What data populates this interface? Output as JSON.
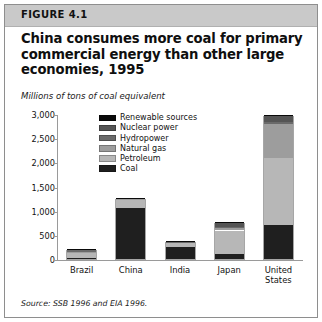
{
  "figure": {
    "header_label": "FIGURE 4.1",
    "title": "China consumes more coal for primary commercial energy than other large economies, 1995",
    "subtitle": "Millions of tons of coal equivalent",
    "source": "Source: SSB 1996 and EIA 1996."
  },
  "colors": {
    "coal": "#1f1f1f",
    "petroleum": "#b7b7b7",
    "natural_gas": "#9d9d9d",
    "hydropower": "#6a6a6a",
    "nuclear_power": "#555555",
    "renewable_sources": "#0a0a0a",
    "axis": "#9a9a9a",
    "header_band": "#c9c9c9",
    "border": "#8e8e8e"
  },
  "chart_data": {
    "type": "bar",
    "title": "China consumes more coal for primary commercial energy than other large economies, 1995",
    "subtitle": "Millions of tons of coal equivalent",
    "xlabel": "",
    "ylabel": "Millions of tons of coal equivalent",
    "ylim": [
      0,
      3000
    ],
    "yticks": [
      "0",
      "500",
      "1,000",
      "1,500",
      "2,000",
      "2,500",
      "3,000"
    ],
    "ytick_values": [
      0,
      500,
      1000,
      1500,
      2000,
      2500,
      3000
    ],
    "grid": false,
    "stacked": true,
    "legend_position": "inside-top-center",
    "categories": [
      "Brazil",
      "China",
      "India",
      "Japan",
      "United States"
    ],
    "series": [
      {
        "name": "Coal",
        "color": "#1f1f1f",
        "values": [
          20,
          1050,
          250,
          110,
          700
        ]
      },
      {
        "name": "Petroleum",
        "color": "#b7b7b7",
        "values": [
          120,
          180,
          85,
          480,
          1400
        ]
      },
      {
        "name": "Natural gas",
        "color": "#9d9d9d",
        "values": [
          10,
          10,
          15,
          55,
          700
        ]
      },
      {
        "name": "Hydropower",
        "color": "#6a6a6a",
        "values": [
          45,
          25,
          10,
          20,
          30
        ]
      },
      {
        "name": "Nuclear power",
        "color": "#555555",
        "values": [
          5,
          5,
          5,
          95,
          120
        ]
      },
      {
        "name": "Renewable sources",
        "color": "#0a0a0a",
        "values": [
          2,
          2,
          2,
          5,
          20
        ]
      }
    ],
    "totals": [
      202,
      1272,
      367,
      765,
      2970
    ]
  },
  "legend": {
    "items": [
      {
        "label": "Renewable sources",
        "color": "#0a0a0a"
      },
      {
        "label": "Nuclear power",
        "color": "#555555"
      },
      {
        "label": "Hydropower",
        "color": "#6a6a6a"
      },
      {
        "label": "Natural gas",
        "color": "#9d9d9d"
      },
      {
        "label": "Petroleum",
        "color": "#b7b7b7"
      },
      {
        "label": "Coal",
        "color": "#1f1f1f"
      }
    ]
  }
}
